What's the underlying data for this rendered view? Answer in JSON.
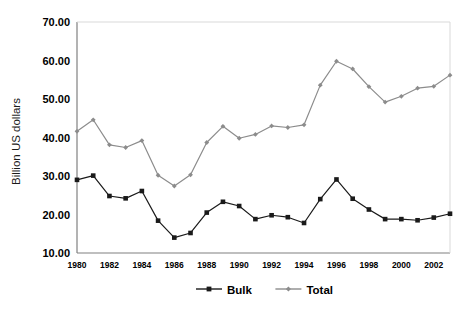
{
  "chart_data": {
    "type": "line",
    "title": "",
    "xlabel": "",
    "ylabel": "Billion US dollars",
    "xlim": [
      1980,
      2003
    ],
    "ylim": [
      10.0,
      70.0
    ],
    "ytick_labels": [
      "70.00",
      "60.00",
      "50.00",
      "40.00",
      "30.00",
      "20.00",
      "10.00"
    ],
    "ytick_values": [
      70,
      60,
      50,
      40,
      30,
      20,
      10
    ],
    "x": [
      1980,
      1981,
      1982,
      1983,
      1984,
      1985,
      1986,
      1987,
      1988,
      1989,
      1990,
      1991,
      1992,
      1993,
      1994,
      1995,
      1996,
      1997,
      1998,
      1999,
      2000,
      2001,
      2002,
      2003
    ],
    "xtick_labels": [
      "1980",
      "1982",
      "1984",
      "1986",
      "1988",
      "1990",
      "1992",
      "1994",
      "1996",
      "1998",
      "2000",
      "2002"
    ],
    "xtick_values": [
      1980,
      1982,
      1984,
      1986,
      1988,
      1990,
      1992,
      1994,
      1996,
      1998,
      2000,
      2002
    ],
    "grid": false,
    "legend_position": "bottom",
    "series": [
      {
        "name": "Bulk",
        "color": "#1a1a1a",
        "marker": "square",
        "values": [
          29.0,
          30.1,
          24.8,
          24.2,
          26.1,
          18.4,
          14.0,
          15.2,
          20.5,
          23.3,
          22.2,
          18.8,
          19.8,
          19.3,
          17.8,
          24.0,
          29.1,
          24.1,
          21.3,
          18.8,
          18.8,
          18.5,
          19.2,
          20.2
        ]
      },
      {
        "name": "Total",
        "color": "#8c8c8c",
        "marker": "diamond",
        "values": [
          41.6,
          44.6,
          38.1,
          37.4,
          39.2,
          30.2,
          27.4,
          30.3,
          38.7,
          42.9,
          39.8,
          40.8,
          43.0,
          42.6,
          43.3,
          53.6,
          59.8,
          57.8,
          53.2,
          49.2,
          50.7,
          52.8,
          53.3,
          56.2
        ]
      }
    ],
    "legend": [
      {
        "label": "Bulk",
        "color": "#1a1a1a",
        "marker": "square"
      },
      {
        "label": "Total",
        "color": "#8c8c8c",
        "marker": "diamond"
      }
    ],
    "axis_color": "#808080",
    "plot_area": {
      "left": 77,
      "right": 450,
      "top": 22,
      "bottom": 253
    }
  }
}
